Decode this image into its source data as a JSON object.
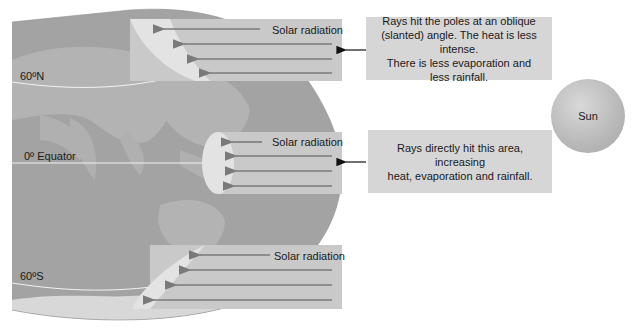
{
  "diagram": {
    "type": "solar-radiation-latitude",
    "latitudes": {
      "north": "60ºN",
      "equator": "0º Equator",
      "south": "60ºS"
    },
    "bands": [
      {
        "id": "north",
        "label": "Solar radiation",
        "arrows": 4
      },
      {
        "id": "equator",
        "label": "Solar radiation",
        "arrows": 4
      },
      {
        "id": "south",
        "label": "Solar radiation",
        "arrows": 4
      }
    ],
    "callouts": {
      "poles": {
        "lines": [
          "Rays hit the poles at an oblique",
          "(slanted) angle. The heat is less intense.",
          "There is less evaporation and",
          "less rainfall."
        ]
      },
      "equator": {
        "lines": [
          "Rays directly hit this area, increasing",
          "heat, evaporation and rainfall."
        ]
      }
    },
    "sun_label": "Sun",
    "colors": {
      "ocean": "#9e9e9e",
      "land": "#b5b5b5",
      "band": "#c9c9c9",
      "impact_area": "#e4e4e4",
      "arrow": "#7a7a7a",
      "callout_bg": "#d6d6d6",
      "latitude_line": "#f5f5f5"
    }
  }
}
